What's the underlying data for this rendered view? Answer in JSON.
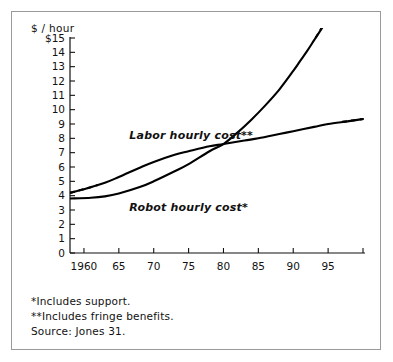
{
  "figure": {
    "background": "#ffffff",
    "border_color": "#9a9a9a",
    "ink_color": "#000000"
  },
  "chart_data": {
    "type": "line",
    "title": "",
    "xlabel": "",
    "ylabel": "$ / hour",
    "xlim": [
      1958,
      2000
    ],
    "ylim": [
      0,
      15
    ],
    "grid": false,
    "legend": "inline-labels",
    "y_ticks": [
      0,
      1,
      2,
      3,
      4,
      5,
      6,
      7,
      8,
      9,
      10,
      11,
      12,
      13,
      14,
      15
    ],
    "y_tick_labels": [
      "0",
      "1",
      "2",
      "3",
      "4",
      "5",
      "6",
      "7",
      "8",
      "9",
      "10",
      "11",
      "12",
      "13",
      "14",
      "$15"
    ],
    "x_ticks": [
      1960,
      1965,
      1970,
      1975,
      1980,
      1985,
      1990,
      1995,
      2000
    ],
    "x_tick_labels": [
      "1960",
      "65",
      "70",
      "75",
      "80",
      "85",
      "90",
      "95",
      ""
    ],
    "crossover": {
      "x": 1980,
      "y": 7.6
    },
    "series": [
      {
        "name": "Labor hourly cost**",
        "label": "Labor hourly cost**",
        "label_x": 1966.5,
        "label_y": 7.95,
        "style": "solid-with-dashed-ends",
        "x": [
          1958,
          1960,
          1963,
          1965,
          1968,
          1970,
          1973,
          1975,
          1978,
          1980,
          1983,
          1985,
          1988,
          1990,
          1993,
          1995,
          1998,
          2000
        ],
        "values": [
          4.2,
          4.45,
          4.9,
          5.3,
          5.95,
          6.35,
          6.85,
          7.1,
          7.45,
          7.6,
          7.85,
          8.0,
          8.3,
          8.5,
          8.8,
          9.0,
          9.2,
          9.35
        ],
        "dashed_lead_x": [
          1958,
          1960,
          1962
        ],
        "dashed_lead_values": [
          4.2,
          4.45,
          4.75
        ],
        "dashed_tail_x": [
          1997,
          1998.5,
          2000
        ],
        "dashed_tail_values": [
          9.15,
          9.25,
          9.35
        ]
      },
      {
        "name": "Robot hourly cost*",
        "label": "Robot hourly cost*",
        "label_x": 1966.5,
        "label_y": 2.95,
        "style": "solid-with-dashed-tail",
        "x": [
          1958,
          1961,
          1963,
          1965,
          1968,
          1970,
          1973,
          1975,
          1978,
          1980,
          1982,
          1984,
          1986,
          1988,
          1990,
          1991,
          1992,
          1993,
          1994,
          1995
        ],
        "values": [
          3.8,
          3.85,
          3.95,
          4.15,
          4.6,
          5.0,
          5.7,
          6.2,
          7.1,
          7.6,
          8.4,
          9.3,
          10.3,
          11.4,
          12.7,
          13.4,
          14.1,
          14.85,
          15.6,
          16.4
        ],
        "dashed_tail_x": [
          1993.2,
          1994,
          1995
        ],
        "dashed_tail_values": [
          15.0,
          15.65,
          16.45
        ]
      }
    ],
    "footnotes": [
      "*Includes support.",
      "**Includes fringe benefits.",
      "Source: Jones 31."
    ]
  }
}
